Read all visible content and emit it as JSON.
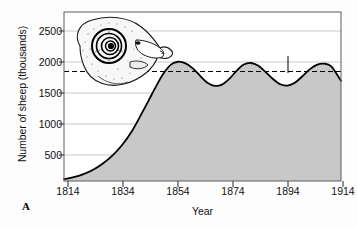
{
  "figure": {
    "panel_label": "A",
    "title_line1": "Growth of a sheep population",
    "title_line2": "introduced into an island"
  },
  "annotations": {
    "carrying_capacity_label": "Carrying capacity?"
  },
  "colors": {
    "fill": "#c8c8c8",
    "curve": "#000000",
    "gridline": "#b9b9b9",
    "axis": "#6b6b6b",
    "plot_background": "#ffffff",
    "text": "#111111"
  },
  "chart_data": {
    "type": "area",
    "title": "Growth of a sheep population introduced into an island",
    "xlabel": "Year",
    "ylabel": "Number of sheep (thousands)",
    "xlim": [
      1808,
      1922
    ],
    "ylim": [
      0,
      2700
    ],
    "xticks": [
      1814,
      1834,
      1854,
      1874,
      1894,
      1914
    ],
    "yticks": [
      500,
      1000,
      1500,
      2000,
      2500
    ],
    "grid": true,
    "legend": null,
    "carrying_capacity": 1750,
    "series": [
      {
        "name": "Sheep population",
        "x": [
          1808,
          1812,
          1816,
          1820,
          1824,
          1828,
          1832,
          1836,
          1840,
          1843,
          1846,
          1849,
          1852,
          1855,
          1858,
          1861,
          1864,
          1867,
          1870,
          1873,
          1876,
          1879,
          1882,
          1885,
          1888,
          1891,
          1894,
          1897,
          1900,
          1903,
          1906,
          1909,
          1912,
          1915,
          1918,
          1922
        ],
        "y": [
          30,
          60,
          110,
          180,
          280,
          410,
          580,
          800,
          1080,
          1300,
          1520,
          1720,
          1860,
          1905,
          1880,
          1800,
          1680,
          1570,
          1520,
          1540,
          1630,
          1760,
          1860,
          1885,
          1840,
          1740,
          1630,
          1545,
          1525,
          1570,
          1670,
          1780,
          1855,
          1875,
          1830,
          1600
        ]
      }
    ],
    "annotations": [
      {
        "text": "Carrying capacity?",
        "points_to_x": 1894,
        "points_to_y": 1750
      }
    ]
  }
}
